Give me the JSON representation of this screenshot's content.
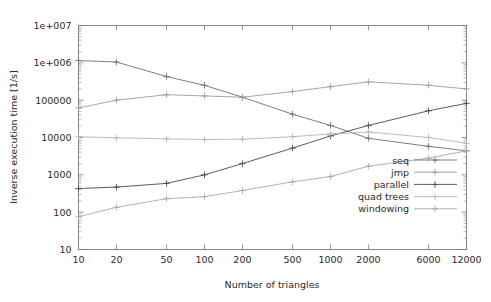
{
  "chart_data": {
    "type": "line",
    "title": "",
    "subtitle": "",
    "xlabel": "Number of triangles",
    "ylabel": "Inverse execution time [1/s]",
    "xscale": "log",
    "yscale": "log",
    "xlim": [
      10,
      12000
    ],
    "ylim": [
      10,
      10000000
    ],
    "grid": false,
    "legend_position": "bottom-right",
    "x": [
      10,
      20,
      50,
      100,
      200,
      500,
      1000,
      2000,
      6000,
      12000
    ],
    "xtick_labels": [
      "10",
      "20",
      "50",
      "100",
      "200",
      "500",
      "1000",
      "2000",
      "6000",
      "12000"
    ],
    "ytick_labels": [
      "10",
      "100",
      "1000",
      "10000",
      "100000",
      "1e+006",
      "1e+007"
    ],
    "ytick_values": [
      10,
      100,
      1000,
      10000,
      100000,
      1000000,
      10000000
    ],
    "series": [
      {
        "name": "seq",
        "color": "#6f6f6f",
        "marker": "plus",
        "values": [
          1150000,
          1050000,
          430000,
          250000,
          120000,
          42000,
          21000,
          9500,
          5800,
          4400
        ]
      },
      {
        "name": "jmp",
        "color": "#9c9c9c",
        "marker": "plus",
        "values": [
          62000,
          100000,
          140000,
          130000,
          120000,
          170000,
          230000,
          310000,
          250000,
          200000
        ]
      },
      {
        "name": "parallel",
        "color": "#4a4a4a",
        "marker": "plus",
        "values": [
          430,
          470,
          590,
          1000,
          2000,
          5200,
          11000,
          21000,
          52000,
          82000
        ]
      },
      {
        "name": "quad trees",
        "color": "#b4b4b4",
        "marker": "plus",
        "values": [
          10500,
          9800,
          9200,
          8800,
          9000,
          10500,
          12500,
          14000,
          10000,
          7000
        ]
      },
      {
        "name": "windowing",
        "color": "#a8a8a8",
        "marker": "plus",
        "values": [
          75,
          135,
          230,
          260,
          380,
          650,
          900,
          1700,
          2800,
          4400
        ]
      }
    ]
  },
  "legend": {
    "entries": [
      {
        "label": "seq"
      },
      {
        "label": "jmp"
      },
      {
        "label": "parallel"
      },
      {
        "label": "quad trees"
      },
      {
        "label": "windowing"
      }
    ]
  }
}
